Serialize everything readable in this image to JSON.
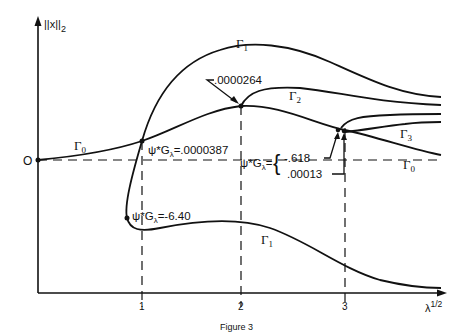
{
  "figure": {
    "caption": "Figure 3",
    "y_axis_label": "||x||",
    "y_axis_sub": "2",
    "x_axis_label": "λ",
    "x_axis_sup": "1/2",
    "origin_label": "O",
    "x_ticks": [
      "1",
      "2",
      "3"
    ]
  },
  "branches": {
    "gamma0_left": {
      "sym": "Γ",
      "sub": "0"
    },
    "gamma0_right": {
      "sym": "Γ",
      "sub": "0"
    },
    "gamma1_top": {
      "sym": "Γ",
      "sub": "1"
    },
    "gamma1_bottom": {
      "sym": "Γ",
      "sub": "1"
    },
    "gamma2": {
      "sym": "Γ",
      "sub": "2"
    },
    "gamma3": {
      "sym": "Γ",
      "sub": "3"
    }
  },
  "annotations": {
    "a1": "ψ*G",
    "a1_sub": "λ",
    "a1_val": "=.0000387",
    "a2": "ψ*G",
    "a2_sub": "λ",
    "a2_val": "=-6.40",
    "a3": "ψ*G",
    "a3_sub": "λ",
    "a3_eq": "=",
    "a3_val1": "-.618",
    "a3_val2": ".00013",
    "a4_val": ".0000264"
  },
  "colors": {
    "ink": "#111111",
    "background": "#ffffff"
  }
}
